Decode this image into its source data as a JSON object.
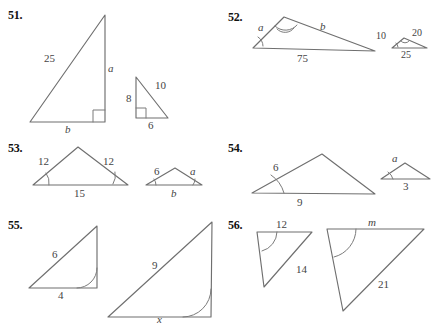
{
  "page": {
    "background": "#ffffff",
    "stroke_color": "#6f6f6f",
    "text_color": "#444444",
    "number_color": "#111111"
  },
  "problems": [
    {
      "number": "51.",
      "figures": [
        {
          "shape": "right-triangle",
          "labels": [
            "25",
            "a",
            "b"
          ],
          "right_angle": true
        },
        {
          "shape": "right-triangle",
          "labels": [
            "8",
            "10",
            "6"
          ],
          "right_angle": true
        }
      ]
    },
    {
      "number": "52.",
      "figures": [
        {
          "shape": "scalene-triangle",
          "labels": [
            "a",
            "b",
            "75"
          ],
          "right_angle": false
        },
        {
          "shape": "scalene-triangle",
          "labels": [
            "10",
            "20",
            "25"
          ],
          "right_angle": false
        }
      ]
    },
    {
      "number": "53.",
      "figures": [
        {
          "shape": "isosceles-triangle",
          "labels": [
            "12",
            "12",
            "15"
          ],
          "right_angle": false
        },
        {
          "shape": "isosceles-triangle",
          "labels": [
            "6",
            "a",
            "b"
          ],
          "right_angle": false
        }
      ]
    },
    {
      "number": "54.",
      "figures": [
        {
          "shape": "scalene-triangle",
          "labels": [
            "6",
            "9"
          ],
          "right_angle": false
        },
        {
          "shape": "scalene-triangle",
          "labels": [
            "a",
            "3"
          ],
          "right_angle": false
        }
      ]
    },
    {
      "number": "55.",
      "figures": [
        {
          "shape": "right-triangle",
          "labels": [
            "6",
            "4"
          ],
          "right_angle": false
        },
        {
          "shape": "right-triangle",
          "labels": [
            "9",
            "x"
          ],
          "right_angle": false
        }
      ]
    },
    {
      "number": "56.",
      "figures": [
        {
          "shape": "obtuse-triangle",
          "labels": [
            "12",
            "14"
          ],
          "right_angle": false
        },
        {
          "shape": "obtuse-triangle",
          "labels": [
            "m",
            "21"
          ],
          "right_angle": false
        }
      ]
    }
  ],
  "labels": {
    "p51": {
      "num": "51.",
      "big_hyp": "25",
      "big_vert": "a",
      "big_base": "b",
      "small_vert": "8",
      "small_hyp": "10",
      "small_base": "6"
    },
    "p52": {
      "num": "52.",
      "big_left": "a",
      "big_right": "b",
      "big_base": "75",
      "small_left": "10",
      "small_right": "20",
      "small_base": "25"
    },
    "p53": {
      "num": "53.",
      "big_left": "12",
      "big_right": "12",
      "big_base": "15",
      "small_left": "6",
      "small_right": "a",
      "small_base": "b"
    },
    "p54": {
      "num": "54.",
      "big_left": "6",
      "big_base": "9",
      "small_left": "a",
      "small_base": "3"
    },
    "p55": {
      "num": "55.",
      "small_hyp": "6",
      "small_base": "4",
      "big_hyp": "9",
      "big_base": "x"
    },
    "p56": {
      "num": "56.",
      "small_top": "12",
      "small_side": "14",
      "big_top": "m",
      "big_side": "21"
    }
  }
}
